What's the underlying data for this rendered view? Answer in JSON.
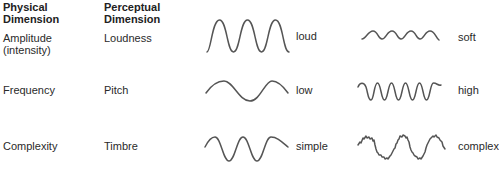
{
  "headers": {
    "physical": [
      "Physical",
      "Dimension"
    ],
    "perceptual": [
      "Perceptual",
      "Dimension"
    ]
  },
  "rows": [
    {
      "physical": [
        "Amplitude",
        "(intensity)"
      ],
      "perceptual": "Loudness",
      "left_label": "loud",
      "right_label": "soft"
    },
    {
      "physical": [
        "Frequency"
      ],
      "perceptual": "Pitch",
      "left_label": "low",
      "right_label": "high"
    },
    {
      "physical": [
        "Complexity"
      ],
      "perceptual": "Timbre",
      "left_label": "simple",
      "right_label": "complex"
    }
  ],
  "waves": {
    "loud": {
      "cycles": 3,
      "amplitude": "large"
    },
    "soft": {
      "cycles": 4,
      "amplitude": "small"
    },
    "low": {
      "cycles": 1.5,
      "amplitude": "medium"
    },
    "high": {
      "cycles": 5,
      "amplitude": "medium"
    },
    "simple": {
      "cycles": 3,
      "amplitude": "medium",
      "shape": "pure sine"
    },
    "complex": {
      "cycles": 3,
      "amplitude": "medium",
      "shape": "noisy sine"
    }
  },
  "colors": {
    "wave_stroke": "#555555",
    "text": "#2a2a2a",
    "background": "#ffffff"
  }
}
